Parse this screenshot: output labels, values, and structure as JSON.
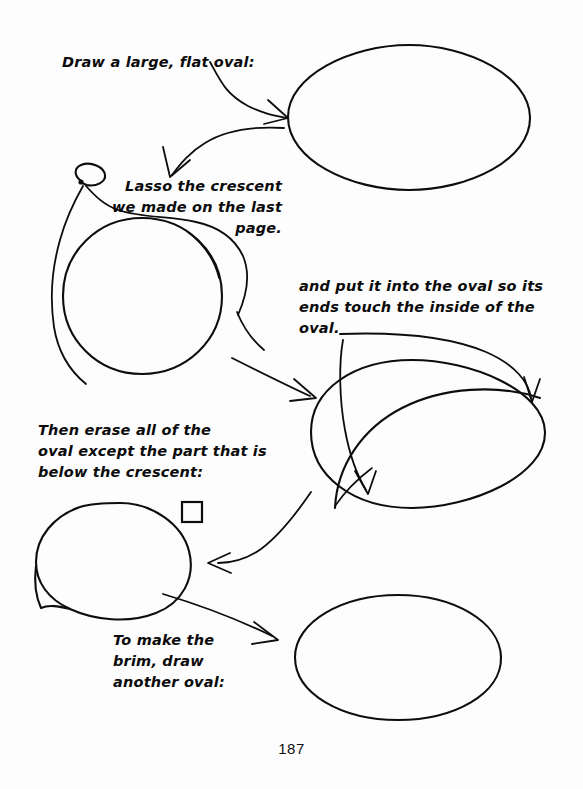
{
  "page": {
    "background_color": "#fdfdfd",
    "ink_color": "#0d0d0d",
    "number": "187"
  },
  "captions": {
    "draw_oval": "Draw a large, flat oval:",
    "lasso": "Lasso the crescent\nwe made on the last\npage.",
    "put_into_oval": "and put it into the oval so its\nends touch the inside of the\noval.",
    "erase": "Then erase all of the\noval except the part that is\nbelow the crescent:",
    "brim": "To make the\nbrim, draw\nanother oval:"
  },
  "figures": {
    "oval_top": "large-flat-oval",
    "lassoed_crescent": "crescent-with-lasso-rope",
    "oval_with_crescent": "oval-containing-crescent",
    "erased_shape": "crescent-hat-crown",
    "oval_bottom": "brim-oval",
    "marker_square": "small-square-marker"
  },
  "arrows": {
    "to_oval_top": "arrow-right-to-top-oval",
    "oval_to_lasso": "arrow-down-left-to-lasso",
    "lasso_to_oval_crescent": "arrow-right-to-oval-with-crescent",
    "oval_crescent_to_erased": "arrow-down-left-to-erased-shape",
    "erased_to_brim": "arrow-down-right-to-brim-oval",
    "oval_leader_right": "leader-curve-to-right-inside-edge",
    "oval_leader_down": "leader-curve-to-lower-inside-edge"
  }
}
